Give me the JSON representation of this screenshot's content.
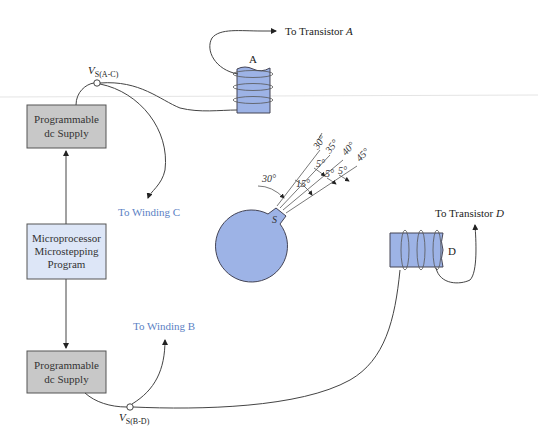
{
  "blocks": {
    "supply_top": {
      "line1": "Programmable",
      "line2": "dc Supply"
    },
    "microprocessor": {
      "line1": "Microprocessor",
      "line2": "Microstepping",
      "line3": "Program"
    },
    "supply_bottom": {
      "line1": "Programmable",
      "line2": "dc Supply"
    }
  },
  "nodes": {
    "vs_ac": {
      "main": "V",
      "sub": "S(A-C)"
    },
    "vs_bd": {
      "main": "V",
      "sub": "S(B-D)"
    }
  },
  "labels": {
    "to_transistor_a": {
      "prefix": "To Transistor ",
      "italic": "A"
    },
    "to_transistor_d": {
      "prefix": "To Transistor ",
      "italic": "D"
    },
    "to_winding_c": "To Winding C",
    "to_winding_b": "To Winding B",
    "coil_a": "A",
    "coil_d": "D",
    "rotor_pole": "S"
  },
  "angles": {
    "start": "30°",
    "rays": [
      "30°",
      "35°",
      "40°",
      "45°"
    ],
    "steps": [
      "5°",
      "5°",
      "5°"
    ],
    "total": "15°"
  },
  "colors": {
    "supply_fill": "#c8c8c8",
    "micro_fill": "#dde6f7",
    "iron_fill": "#9db3e6",
    "accent_text": "#5b7fc4"
  }
}
